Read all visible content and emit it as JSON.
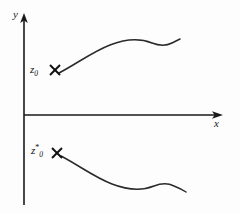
{
  "figure": {
    "background_color": "#fdfdfd",
    "ink_color": "#1a1a1a",
    "width": 240,
    "height": 213
  },
  "axes": {
    "x_label": "x",
    "y_label": "y",
    "origin": {
      "x": 24,
      "y": 115
    },
    "x_axis": {
      "start_x": 24,
      "end_x": 222,
      "y": 115,
      "arrow": "right"
    },
    "y_axis": {
      "x": 24,
      "start_y": 205,
      "end_y": 14,
      "arrow": "up"
    }
  },
  "points": [
    {
      "id": "z0",
      "label_base": "z",
      "label_sub": "0",
      "label_sup": "",
      "marker": "x-cross-marker",
      "x": 55,
      "y": 70,
      "description": "initial point above the real axis"
    },
    {
      "id": "z0-star",
      "label_base": "z",
      "label_sub": "0",
      "label_sup": "*",
      "marker": "x-cross-marker",
      "x": 57,
      "y": 153,
      "description": "complex conjugate initial point below the real axis"
    }
  ],
  "curves": [
    {
      "id": "upper-trajectory",
      "from_point": "z0",
      "path": "M 59 73 C 78 63 92 52 110 45 C 128 38 142 39 152 43 C 160 46 166 46 172 43 C 176 41 178 40 180 39",
      "description": "trajectory rising from z0, flattening, dipping, then rising"
    },
    {
      "id": "lower-trajectory",
      "from_point": "z0-star",
      "path": "M 61 156 C 80 166 94 177 112 184 C 130 191 144 190 154 186 C 162 183 168 183 174 186 C 179 188 183 190 186 192",
      "description": "mirror trajectory descending from z0*, flattening, rising, then descending"
    }
  ]
}
